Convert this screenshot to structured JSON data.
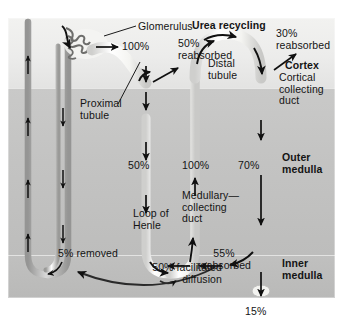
{
  "figure": {
    "title": "Urea recycling"
  },
  "zones": {
    "cortex": "Cortex",
    "outer_medulla": "Outer\nmedulla",
    "inner_medulla": "Inner\nmedulla"
  },
  "structures": {
    "glomerulus": "Glomerulus",
    "proximal_tubule": "Proximal\ntubule",
    "distal_tubule": "Distal\ntubule",
    "loop_of_henle": "Loop of\nHenle",
    "cortical_collecting_duct": "Cortical\ncollecting\nduct",
    "medullary_collecting_duct": "Medullary—\ncollecting\nduct"
  },
  "values": {
    "filtered_100": "100%",
    "proximal_reabsorbed": "50%\nreabsorbed",
    "remaining_50": "50%",
    "ascending_100": "100%",
    "ccd_reabsorbed": "30%\nreabsorbed",
    "mcd_70": "70%",
    "mcd_reabsorbed": "55%\nreabsorbed",
    "excreted_15": "15%",
    "vasa_removed": "5% removed",
    "facilitated_diffusion": "50% facilitated\ndiffusion"
  },
  "colors": {
    "tubule": "#f8f8f6",
    "arrow": "#101010",
    "cortex_bg": "#ececeb",
    "outer_medulla_bg": "#c3c3c2",
    "inner_medulla_bg": "#bcbcbb",
    "text": "#141414"
  }
}
